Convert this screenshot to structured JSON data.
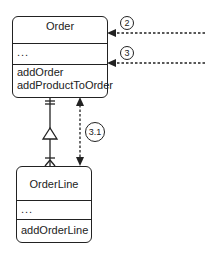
{
  "classes": {
    "order": {
      "name": "Order",
      "attributes": "...",
      "operations": [
        "addOrder",
        "addProductToOrder"
      ]
    },
    "order_line": {
      "name": "OrderLine",
      "attributes": "...",
      "operations": [
        "addOrderLine"
      ]
    }
  },
  "messages": [
    {
      "label": "2",
      "target": "Order",
      "style": "dashed-arrow"
    },
    {
      "label": "3",
      "target": "Order",
      "style": "dashed-arrow"
    },
    {
      "label": "3.1",
      "between": [
        "Order",
        "OrderLine"
      ],
      "style": "dashed-bidirectional-arrow"
    }
  ],
  "relationship": {
    "from": "Order",
    "to": "OrderLine",
    "order_end": "one-and-only-one",
    "order_line_end": "one-or-many",
    "marker": "triangle"
  }
}
